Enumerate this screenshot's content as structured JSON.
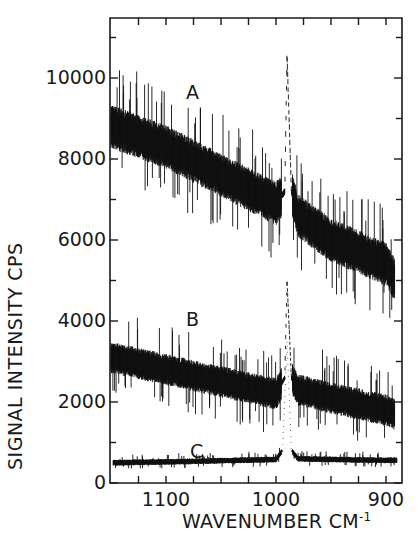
{
  "chart_data": {
    "type": "line",
    "title": "",
    "xlabel": "WAVENUMBER",
    "xlabel_unit": "CM",
    "xlabel_unit_exp": "-1",
    "ylabel": "SIGNAL INTENSITY  CPS",
    "xlim": [
      1152,
      888
    ],
    "ylim": [
      0,
      11500
    ],
    "x_reversed": true,
    "grid": false,
    "legend": "inline labels",
    "y_ticks": [
      "0",
      "2000",
      "4000",
      "6000",
      "8000",
      "10000"
    ],
    "y_tick_values": [
      0,
      2000,
      4000,
      6000,
      8000,
      10000
    ],
    "x_ticks": [
      "1100",
      "1000",
      "900"
    ],
    "x_tick_values": [
      1100,
      1000,
      900
    ],
    "peak_position": 990,
    "series": [
      {
        "name": "A",
        "x": [
          1150,
          1100,
          1050,
          1000,
          992,
          990,
          986,
          980,
          950,
          900,
          892
        ],
        "values": [
          8800,
          8300,
          7600,
          6900,
          7200,
          10600,
          7200,
          6600,
          6000,
          5400,
          5000
        ],
        "noise": 900
      },
      {
        "name": "B",
        "x": [
          1150,
          1100,
          1050,
          1000,
          992,
          990,
          986,
          980,
          950,
          900,
          892
        ],
        "values": [
          3100,
          2800,
          2500,
          2200,
          2600,
          5000,
          2600,
          2300,
          2100,
          1800,
          1700
        ],
        "noise": 650
      },
      {
        "name": "C",
        "x": [
          1148,
          1100,
          1050,
          1000,
          994,
          990,
          986,
          980,
          950,
          900,
          890
        ],
        "values": [
          500,
          520,
          550,
          580,
          800,
          3500,
          800,
          600,
          580,
          560,
          560
        ],
        "noise": 120
      }
    ]
  },
  "labels": {
    "A": "A",
    "B": "B",
    "C": "C"
  }
}
